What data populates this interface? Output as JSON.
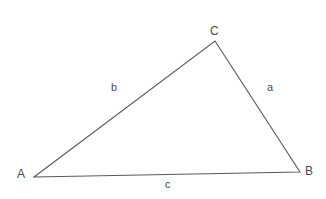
{
  "figure": {
    "type": "triangle-diagram",
    "background_color": "#ffffff",
    "stroke_color": "#5a5a5a",
    "text_color": "#4a4a4a",
    "width": 326,
    "height": 199
  },
  "vertices": [
    {
      "id": "A",
      "label": "A",
      "x": 34,
      "y": 177
    },
    {
      "id": "B",
      "label": "B",
      "x": 300,
      "y": 172
    },
    {
      "id": "C",
      "label": "C",
      "x": 215,
      "y": 41
    }
  ],
  "sides": [
    {
      "id": "a",
      "label": "a",
      "from": "C",
      "to": "B"
    },
    {
      "id": "b",
      "label": "b",
      "from": "A",
      "to": "C"
    },
    {
      "id": "c",
      "label": "c",
      "from": "A",
      "to": "B"
    }
  ]
}
